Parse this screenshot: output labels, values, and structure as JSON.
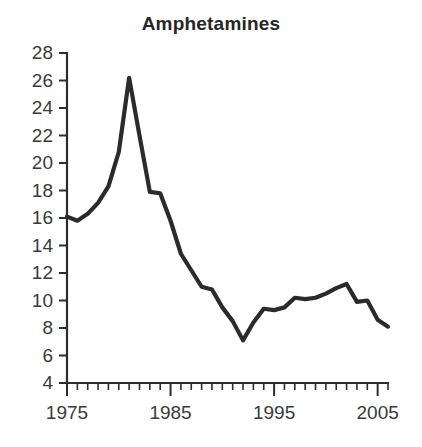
{
  "chart_data": {
    "type": "line",
    "title": "Amphetamines",
    "xlabel": "",
    "ylabel": "",
    "xlim": [
      1975,
      2006
    ],
    "ylim": [
      4,
      28
    ],
    "grid": false,
    "legend": null,
    "y_ticks": [
      4,
      6,
      8,
      10,
      12,
      14,
      16,
      18,
      20,
      22,
      24,
      26,
      28
    ],
    "y_tick_labels": [
      "4",
      "6",
      "8",
      "10",
      "12",
      "14",
      "16",
      "18",
      "20",
      "22",
      "24",
      "26",
      "28"
    ],
    "x_ticks": [
      1975,
      1985,
      1995,
      2005
    ],
    "x_tick_labels": [
      "1975",
      "1985",
      "1995",
      "2005"
    ],
    "x_minor_tick_step": 1,
    "x": [
      1975,
      1976,
      1977,
      1978,
      1979,
      1980,
      1981,
      1982,
      1983,
      1984,
      1985,
      1986,
      1987,
      1988,
      1989,
      1990,
      1991,
      1992,
      1993,
      1994,
      1995,
      1996,
      1997,
      1998,
      1999,
      2000,
      2001,
      2002,
      2003,
      2004,
      2005,
      2006
    ],
    "categories": [
      "1975",
      "1976",
      "1977",
      "1978",
      "1979",
      "1980",
      "1981",
      "1982",
      "1983",
      "1984",
      "1985",
      "1986",
      "1987",
      "1988",
      "1989",
      "1990",
      "1991",
      "1992",
      "1993",
      "1994",
      "1995",
      "1996",
      "1997",
      "1998",
      "1999",
      "2000",
      "2001",
      "2002",
      "2003",
      "2004",
      "2005",
      "2006"
    ],
    "values": [
      16.1,
      15.8,
      16.3,
      17.1,
      18.3,
      20.8,
      26.2,
      22.0,
      17.9,
      17.8,
      15.8,
      13.4,
      12.2,
      11.0,
      10.8,
      9.5,
      8.5,
      7.1,
      8.4,
      9.4,
      9.3,
      9.5,
      10.2,
      10.1,
      10.2,
      10.5,
      10.9,
      11.2,
      9.9,
      10.0,
      8.6,
      8.1
    ],
    "series": [
      {
        "name": "Amphetamines",
        "values": [
          16.1,
          15.8,
          16.3,
          17.1,
          18.3,
          20.8,
          26.2,
          22.0,
          17.9,
          17.8,
          15.8,
          13.4,
          12.2,
          11.0,
          10.8,
          9.5,
          8.5,
          7.1,
          8.4,
          9.4,
          9.3,
          9.5,
          10.2,
          10.1,
          10.2,
          10.5,
          10.9,
          11.2,
          9.9,
          10.0,
          8.6,
          8.1
        ],
        "color": "#2b2b2b"
      }
    ],
    "annotations": []
  },
  "colors": {
    "line": "#2b2b2b",
    "axis": "#2d2d2d",
    "text": "#3a3a3a",
    "title": "#262626",
    "background": "#ffffff"
  }
}
